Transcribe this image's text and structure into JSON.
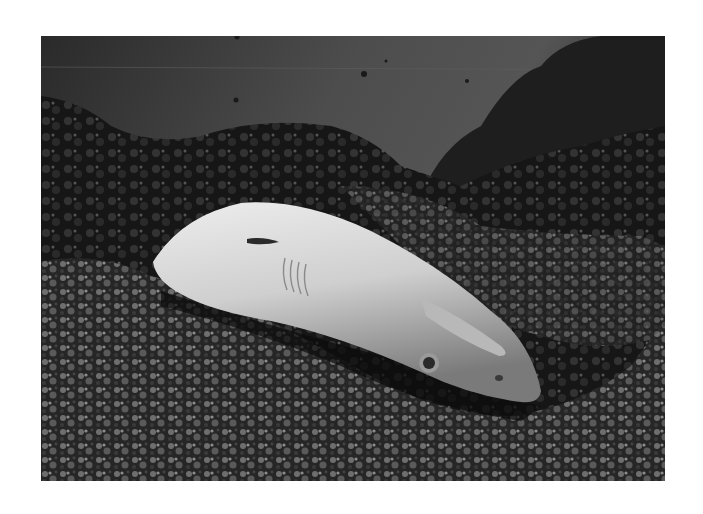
{
  "photo": {
    "subject": "shark lying on coral reef",
    "style": "black-and-white underwater photograph",
    "frame": {
      "x": 41,
      "y": 36,
      "width": 624,
      "height": 445
    },
    "colors": {
      "page_background": "#ffffff",
      "water": "#4a4a4a",
      "water_dark": "#222222",
      "reef_dark": "#111111",
      "reef_light": "#8a8a8a",
      "shark_body": "#d9d9d9",
      "shark_shadow": "#6a6a6a"
    }
  }
}
